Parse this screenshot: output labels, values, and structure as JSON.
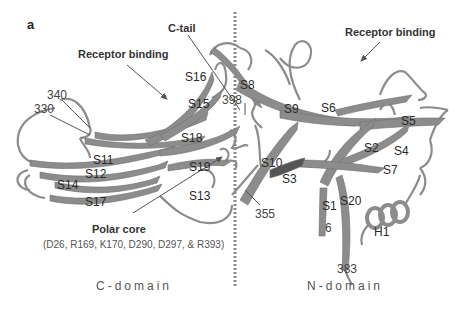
{
  "panel_label": "a",
  "annotations": {
    "c_tail": "C-tail",
    "receptor_binding_left": "Receptor binding",
    "receptor_binding_right": "Receptor binding",
    "polar_core_title": "Polar core",
    "polar_core_residues": "(D26, R169, K170, D290, D297, & R393)"
  },
  "domains": {
    "left": "C-domain",
    "right": "N-domain"
  },
  "strands": {
    "S1": "S1",
    "S2": "S2",
    "S3": "S3",
    "S4": "S4",
    "S5": "S5",
    "S6": "S6",
    "S7": "S7",
    "S8": "S8",
    "S9": "S9",
    "S10": "S10",
    "S11": "S11",
    "S12": "S12",
    "S13": "S13",
    "S14": "S14",
    "S15": "S15",
    "S16": "S16",
    "S17": "S17",
    "S18": "S18",
    "S19": "S19",
    "S20": "S20",
    "H1": "H1"
  },
  "residues": {
    "r340": "340",
    "r330": "330",
    "r398": "398",
    "r355": "355",
    "r6": "6",
    "r383": "383"
  },
  "colors": {
    "ribbon": "#8c8c8c",
    "ribbon_dark": "#6e6e6e",
    "divider": "#8a8a8a",
    "arrow": "#555555"
  }
}
